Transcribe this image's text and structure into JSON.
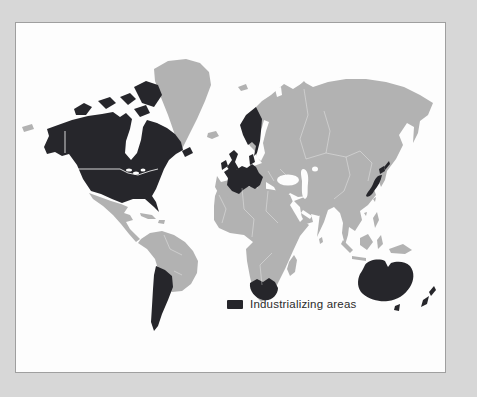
{
  "colors": {
    "frame_outer": "#d7d7d7",
    "frame_border": "#9f9f9f",
    "panel_bg": "#fdfdfd",
    "water": "#fdfdfd",
    "land_default": "#b2b2b2",
    "land_industrializing": "#26262b",
    "border_lines": "#ffffff",
    "legend_text": "#2b2b2b"
  },
  "legend": {
    "label": "Industrializing areas",
    "swatch_color": "#26262b"
  },
  "map": {
    "type": "world-choropleth",
    "categories": [
      {
        "name": "Industrializing areas",
        "color": "#26262b",
        "regions": [
          "canada-and-united-states",
          "alaska",
          "arctic-canada-islands",
          "newfoundland",
          "united-kingdom",
          "ireland",
          "scandinavia",
          "denmark",
          "western-europe",
          "japan",
          "southern-south-america",
          "south-africa",
          "australia",
          "tasmania",
          "new-zealand"
        ]
      },
      {
        "name": "unlabeled-other-areas",
        "color": "#b2b2b2",
        "regions": [
          "greenland",
          "iceland",
          "mexico-and-central-america",
          "caribbean",
          "northern-south-america",
          "africa",
          "madagascar",
          "eurasia",
          "sumatra",
          "java",
          "borneo",
          "sulawesi",
          "new-guinea",
          "philippines",
          "sri-lanka",
          "svalbard",
          "novaya-zemlya",
          "chukotka-fragment"
        ]
      }
    ]
  }
}
